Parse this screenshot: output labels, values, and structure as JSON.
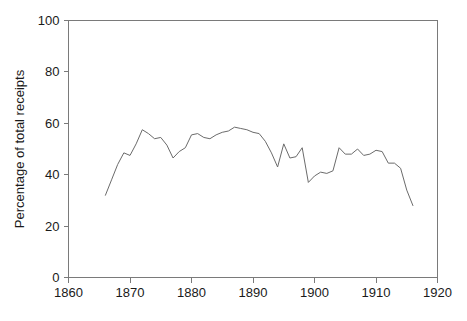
{
  "chart_data": {
    "type": "line",
    "title": "",
    "subtitle": "",
    "xlabel": "",
    "ylabel": "Percentage of total receipts",
    "xlim": [
      1860,
      1920
    ],
    "ylim": [
      0,
      100
    ],
    "xticks": [
      1860,
      1870,
      1880,
      1890,
      1900,
      1910,
      1920
    ],
    "yticks": [
      0,
      20,
      40,
      60,
      80,
      100
    ],
    "xtick_labels": [
      "1860",
      "1870",
      "1880",
      "1890",
      "1900",
      "1910",
      "1920"
    ],
    "ytick_labels": [
      "0",
      "20",
      "40",
      "60",
      "80",
      "100"
    ],
    "grid": false,
    "legend": false,
    "legend_position": "none",
    "annotations": [],
    "line_color": "#6b6b6b",
    "axis_color": "#7a7a7a",
    "background_color": "#ffffff",
    "series": [
      {
        "name": "Percentage of total receipts",
        "x": [
          1866,
          1867,
          1868,
          1869,
          1870,
          1871,
          1872,
          1873,
          1874,
          1875,
          1876,
          1877,
          1878,
          1879,
          1880,
          1881,
          1882,
          1883,
          1884,
          1885,
          1886,
          1887,
          1888,
          1889,
          1890,
          1891,
          1892,
          1893,
          1894,
          1895,
          1896,
          1897,
          1898,
          1899,
          1900,
          1901,
          1902,
          1903,
          1904,
          1905,
          1906,
          1907,
          1908,
          1909,
          1910,
          1911,
          1912,
          1913,
          1914,
          1915,
          1916
        ],
        "values": [
          32.0,
          38.0,
          44.0,
          48.5,
          47.5,
          52.0,
          57.5,
          56.0,
          54.0,
          54.5,
          51.5,
          46.5,
          49.0,
          50.5,
          55.5,
          56.0,
          54.5,
          54.0,
          55.5,
          56.5,
          57.0,
          58.5,
          58.0,
          57.5,
          56.5,
          56.0,
          53.0,
          48.5,
          43.0,
          52.0,
          46.5,
          47.0,
          50.5,
          37.0,
          39.5,
          41.0,
          40.5,
          41.5,
          50.5,
          48.0,
          48.0,
          50.0,
          47.5,
          48.0,
          49.5,
          49.0,
          44.5,
          44.5,
          42.5,
          34.0,
          28.0
        ]
      }
    ]
  },
  "axis": {
    "y_title": "Percentage of total receipts"
  }
}
